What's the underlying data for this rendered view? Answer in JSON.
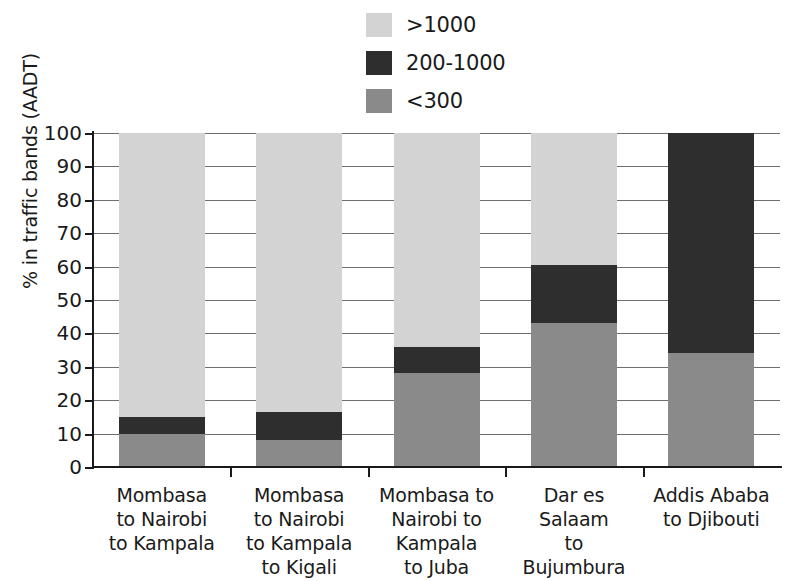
{
  "chart_data": {
    "type": "bar",
    "subtype": "stacked-bar-100",
    "title": "",
    "xlabel": "",
    "ylabel": "% in traffic bands (AADT)",
    "ylim": [
      0,
      100
    ],
    "yticks": [
      0,
      10,
      20,
      30,
      40,
      50,
      60,
      70,
      80,
      90,
      100
    ],
    "ytick_labels": [
      "0",
      "10",
      "20",
      "30",
      "40",
      "50",
      "60",
      "70",
      "80",
      "90",
      "100"
    ],
    "grid": true,
    "legend_position": "top-center",
    "categories": [
      "Mombasa to Nairobi to Kampala",
      "Mombasa to Nairobi to Kampala to Kigali",
      "Mombasa to Nairobi to Kampala to Juba",
      "Dar es Salaam to Bujumbura",
      "Addis Ababa to Djibouti"
    ],
    "category_lines": [
      [
        "Mombasa",
        "to Nairobi",
        "to Kampala"
      ],
      [
        "Mombasa",
        "to Nairobi",
        "to Kampala",
        "to Kigali"
      ],
      [
        "Mombasa to",
        "Nairobi to",
        "Kampala",
        "to Juba"
      ],
      [
        "Dar es",
        "Salaam",
        "to",
        "Bujumbura"
      ],
      [
        "Addis Ababa",
        "to Djibouti"
      ]
    ],
    "series": [
      {
        "name": "<300",
        "color": "#8a8a8a",
        "values": [
          10,
          8,
          28,
          43,
          34
        ]
      },
      {
        "name": "200-1000",
        "color": "#2e2e2e",
        "values": [
          5,
          8.5,
          8,
          17.5,
          66
        ]
      },
      {
        "name": ">1000",
        "color": "#d3d3d3",
        "values": [
          85,
          83.5,
          64,
          39.5,
          0
        ]
      }
    ],
    "stack_order_bottom_to_top": [
      "<300",
      "200-1000",
      ">1000"
    ]
  },
  "legend": {
    "items": [
      {
        "label": ">1000",
        "color": "#d3d3d3"
      },
      {
        "label": "200-1000",
        "color": "#2e2e2e"
      },
      {
        "label": "<300",
        "color": "#8a8a8a"
      }
    ]
  }
}
